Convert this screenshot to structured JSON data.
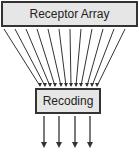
{
  "diagram": {
    "top_box": {
      "label": "Receptor Array"
    },
    "bottom_box": {
      "label": "Recoding"
    },
    "input_lines_count": 12,
    "output_arrows_count": 4,
    "colors": {
      "box_fill": "#e6e6e6",
      "stroke": "#333333"
    }
  }
}
